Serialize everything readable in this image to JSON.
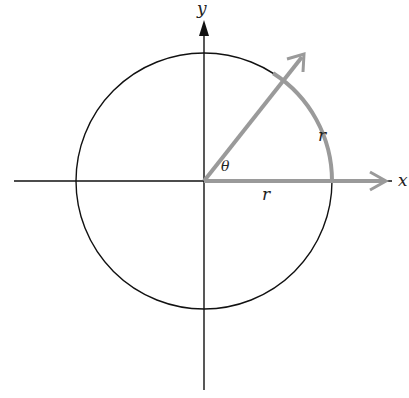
{
  "diagram": {
    "labels": {
      "x_axis": "x",
      "y_axis": "y",
      "angle": "θ",
      "arc_radius": "r",
      "ray_radius": "r"
    },
    "colors": {
      "axes": "#111111",
      "circle": "#111111",
      "highlight": "#9a9a9a",
      "text": "#222222"
    },
    "geometry": {
      "center": [
        204,
        181
      ],
      "radius": 128,
      "angle_degrees": 57.3
    }
  }
}
